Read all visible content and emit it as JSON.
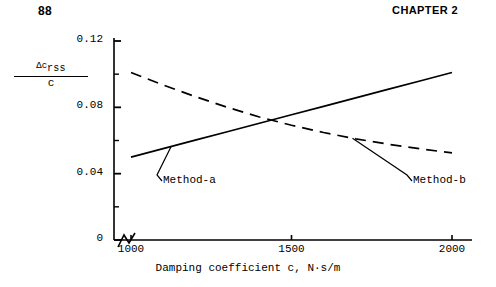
{
  "running_head": {
    "page_number": "88",
    "chapter_label": "CHAPTER 2"
  },
  "figure": {
    "xaxis_title": "Damping coefficient c, N·s/m",
    "yaxis_label": {
      "numerator_base": "Δc",
      "numerator_subscript": "rss",
      "denominator": "c"
    },
    "axis_break_note": "zigzag break on x-axis between origin and first tick"
  },
  "chart_data": {
    "type": "line",
    "title": "",
    "subtitle": "",
    "xlabel": "Damping coefficient c, N·s/m",
    "ylabel": "Δc_rss / c",
    "xlim": [
      950,
      2000
    ],
    "ylim": [
      0,
      0.12
    ],
    "xticks": [
      1000,
      1500,
      2000
    ],
    "xtick_labels": [
      "1000",
      "1500",
      "2000"
    ],
    "yticks": [
      0,
      0.02,
      0.04,
      0.06,
      0.08,
      0.1,
      0.12
    ],
    "ytick_labels": [
      "0",
      "",
      "0.04",
      "",
      "0.08",
      "",
      "0.12"
    ],
    "ytick_major": [
      0,
      0.04,
      0.08,
      0.12
    ],
    "ytick_minor": [
      0.02,
      0.06,
      0.1
    ],
    "grid": false,
    "legend": "inline-annotations",
    "axis_break_x": true,
    "series": [
      {
        "name": "Method-a",
        "style": "solid",
        "label_text": "Method-a",
        "x": [
          1000,
          1100,
          1200,
          1300,
          1400,
          1500,
          1600,
          1700,
          1800,
          1900,
          2000
        ],
        "values": [
          0.05,
          0.0551,
          0.0602,
          0.0653,
          0.0704,
          0.0755,
          0.0806,
          0.0857,
          0.0908,
          0.0959,
          0.101
        ]
      },
      {
        "name": "Method-b",
        "style": "dashed",
        "label_text": "Method-b",
        "x": [
          1000,
          1100,
          1200,
          1300,
          1400,
          1500,
          1600,
          1700,
          1800,
          1900,
          2000
        ],
        "values": [
          0.101,
          0.0935,
          0.0865,
          0.08,
          0.0742,
          0.0692,
          0.0648,
          0.061,
          0.0578,
          0.055,
          0.0525
        ]
      }
    ],
    "annotations": [
      {
        "text": "Method-a",
        "points_to_series": "Method-a",
        "point_x": 1125,
        "point_y": 0.0564
      },
      {
        "text": "Method-b",
        "points_to_series": "Method-b",
        "point_x": 1690,
        "point_y": 0.0613
      }
    ],
    "intersection": {
      "x": 1430,
      "y": 0.0719
    }
  }
}
